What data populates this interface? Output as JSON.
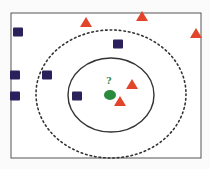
{
  "diagram": {
    "type": "knn-classification",
    "query_label": "?",
    "colors": {
      "background": "#fbfbfb",
      "frame": "#555555",
      "square": "#2b1f5c",
      "triangle": "#e2452a",
      "query": "#2a8a3e",
      "solid_circle": "#333333",
      "dashed_circle": "#333333"
    },
    "frame": {
      "x": 11,
      "y": 13,
      "w": 190,
      "h": 145
    },
    "inner_circle": {
      "cx": 111,
      "cy": 95,
      "rx": 43,
      "ry": 37,
      "style": "solid"
    },
    "outer_circle": {
      "cx": 111,
      "cy": 94,
      "rx": 75,
      "ry": 64,
      "style": "dashed"
    },
    "query_point": {
      "cx": 110,
      "cy": 95,
      "rx": 6,
      "ry": 5
    },
    "squares": [
      {
        "x": 18,
        "y": 32
      },
      {
        "x": 15,
        "y": 75
      },
      {
        "x": 47,
        "y": 75
      },
      {
        "x": 15,
        "y": 96
      },
      {
        "x": 77,
        "y": 96
      },
      {
        "x": 118,
        "y": 44
      }
    ],
    "triangles": [
      {
        "x": 86,
        "y": 22
      },
      {
        "x": 142,
        "y": 16
      },
      {
        "x": 196,
        "y": 33
      },
      {
        "x": 132,
        "y": 84
      },
      {
        "x": 120,
        "y": 101
      }
    ]
  }
}
